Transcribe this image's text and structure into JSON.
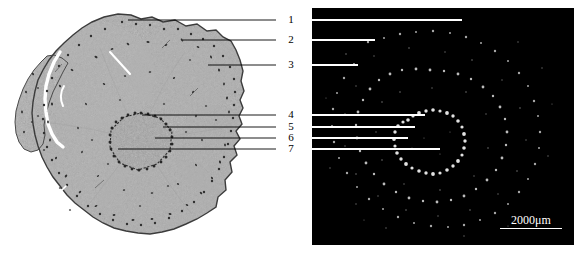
{
  "figure": {
    "caption_numbers": [
      "1",
      "2",
      "3",
      "4",
      "5",
      "6",
      "7"
    ]
  },
  "panels": {
    "left": {
      "name": "histology-section",
      "modality": "brightfield-histology",
      "background_color": "#ffffff",
      "tissue_fill": "#a9a9a9",
      "outline_color": "#3a3a3a"
    },
    "right": {
      "name": "fluorescence-section",
      "modality": "fluorescence-darkfield",
      "background_color": "#000000",
      "speckle_color": "#e8e8e8"
    }
  },
  "scale_bar": {
    "label": "2000μm",
    "color": "#ffffff",
    "length_px": 62
  },
  "callouts": [
    {
      "number": "1",
      "y": 20,
      "label_x": 284,
      "left_line_end_x": 128,
      "right_line_end_x": 462
    },
    {
      "number": "2",
      "y": 40,
      "label_x": 284,
      "left_line_end_x": 183,
      "right_line_end_x": 375
    },
    {
      "number": "3",
      "y": 65,
      "label_x": 284,
      "left_line_end_x": 208,
      "right_line_end_x": 358
    },
    {
      "number": "4",
      "y": 115,
      "label_x": 284,
      "left_line_end_x": 142,
      "right_line_end_x": 425
    },
    {
      "number": "5",
      "y": 127,
      "label_x": 284,
      "left_line_end_x": 163,
      "right_line_end_x": 415
    },
    {
      "number": "6",
      "y": 138,
      "label_x": 284,
      "left_line_end_x": 155,
      "right_line_end_x": 408
    },
    {
      "number": "7",
      "y": 149,
      "label_x": 284,
      "left_line_end_x": 118,
      "right_line_end_x": 440
    }
  ],
  "colors": {
    "line_left": "#000000",
    "line_right": "#ffffff",
    "text": "#000000"
  }
}
